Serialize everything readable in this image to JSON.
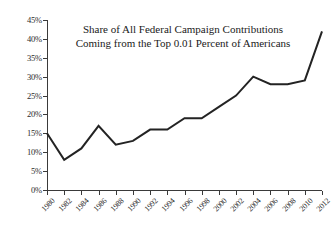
{
  "chart_data": {
    "type": "line",
    "title": "Share of All Federal Campaign Contributions Coming from the Top 0.01 Percent of Americans",
    "title_line1": "Share of All Federal Campaign Contributions",
    "title_line2": "Coming from the Top 0.01 Percent of Americans",
    "xlabel": "",
    "ylabel": "",
    "x": [
      1980,
      1982,
      1984,
      1986,
      1988,
      1990,
      1992,
      1994,
      1996,
      1998,
      2000,
      2002,
      2004,
      2006,
      2008,
      2010,
      2012
    ],
    "values": [
      15,
      8,
      11,
      17,
      12,
      13,
      16,
      16,
      19,
      19,
      22,
      25,
      30,
      28,
      28,
      29,
      42
    ],
    "categories": [
      "1980",
      "1982",
      "1984",
      "1986",
      "1988",
      "1990",
      "1992",
      "1994",
      "1996",
      "1998",
      "2000",
      "2002",
      "2004",
      "2006",
      "2008",
      "2010",
      "2012"
    ],
    "ylim": [
      0,
      45
    ],
    "xlim": [
      1980,
      2012
    ],
    "ytick_values": [
      0,
      5,
      10,
      15,
      20,
      25,
      30,
      35,
      40,
      45
    ],
    "ytick_labels": [
      "0%",
      "5%",
      "10%",
      "15%",
      "20%",
      "25%",
      "30%",
      "35%",
      "40%",
      "45%"
    ],
    "xtick_labels": [
      "1980",
      "1982",
      "1984",
      "1986",
      "1988",
      "1990",
      "1992",
      "1994",
      "1996",
      "1998",
      "2000",
      "2002",
      "2004",
      "2006",
      "2008",
      "2010",
      "2012"
    ],
    "grid": false,
    "legend": false,
    "legend_position": "none",
    "series_color": "#232323",
    "axis_color": "#3a3a3a",
    "background_color": "#ffffff"
  }
}
